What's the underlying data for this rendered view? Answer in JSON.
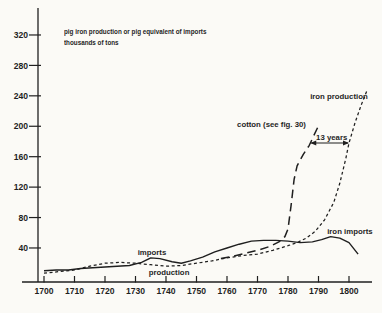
{
  "figure": {
    "title_line1": "pig iron production or pig equivalent of imports",
    "title_line2": "thousands of tons"
  },
  "colors": {
    "ink": "#1f1f1f",
    "paper": "#fbfaf6"
  },
  "chart_data": {
    "type": "line",
    "title": "pig iron production or pig equivalent of imports",
    "subtitle": "thousands of tons",
    "xlabel": "year",
    "ylabel": "thousands of tons",
    "xlim": [
      1693,
      1808
    ],
    "ylim": [
      -6,
      356
    ],
    "grid": false,
    "legend_position": "inline-labels",
    "x_ticks": [
      1700,
      1710,
      1720,
      1730,
      1740,
      1750,
      1760,
      1770,
      1780,
      1790,
      1800
    ],
    "y_ticks": [
      40,
      80,
      120,
      160,
      200,
      240,
      280,
      320
    ],
    "series": [
      {
        "name": "iron imports",
        "line_style": "solid",
        "points": [
          [
            1700,
            10
          ],
          [
            1704,
            11
          ],
          [
            1708,
            11
          ],
          [
            1712,
            13
          ],
          [
            1716,
            14
          ],
          [
            1720,
            15
          ],
          [
            1724,
            16
          ],
          [
            1728,
            17
          ],
          [
            1732,
            21
          ],
          [
            1735,
            27
          ],
          [
            1738,
            26
          ],
          [
            1742,
            22
          ],
          [
            1745,
            20
          ],
          [
            1748,
            23
          ],
          [
            1752,
            28
          ],
          [
            1756,
            35
          ],
          [
            1760,
            40
          ],
          [
            1764,
            45
          ],
          [
            1768,
            49
          ],
          [
            1772,
            50
          ],
          [
            1776,
            50
          ],
          [
            1780,
            49
          ],
          [
            1784,
            47
          ],
          [
            1788,
            48
          ],
          [
            1791,
            51
          ],
          [
            1794,
            55
          ],
          [
            1797,
            53
          ],
          [
            1800,
            47
          ],
          [
            1803,
            32
          ]
        ]
      },
      {
        "name": "iron production",
        "line_style": "short-dash",
        "points": [
          [
            1700,
            7
          ],
          [
            1705,
            9
          ],
          [
            1710,
            11
          ],
          [
            1715,
            16
          ],
          [
            1720,
            20
          ],
          [
            1725,
            21
          ],
          [
            1730,
            20
          ],
          [
            1735,
            18
          ],
          [
            1740,
            16
          ],
          [
            1745,
            17
          ],
          [
            1750,
            20
          ],
          [
            1755,
            23
          ],
          [
            1760,
            27
          ],
          [
            1765,
            30
          ],
          [
            1770,
            32
          ],
          [
            1775,
            37
          ],
          [
            1780,
            43
          ],
          [
            1783,
            47
          ],
          [
            1786,
            53
          ],
          [
            1789,
            62
          ],
          [
            1792,
            77
          ],
          [
            1795,
            100
          ],
          [
            1797,
            125
          ],
          [
            1799,
            158
          ],
          [
            1800,
            178
          ],
          [
            1802,
            205
          ],
          [
            1804,
            228
          ],
          [
            1806,
            248
          ]
        ]
      },
      {
        "name": "cotton (see fig. 30)",
        "line_style": "long-dash",
        "points": [
          [
            1758,
            26
          ],
          [
            1762,
            29
          ],
          [
            1766,
            33
          ],
          [
            1770,
            37
          ],
          [
            1774,
            42
          ],
          [
            1777,
            48
          ],
          [
            1779,
            55
          ],
          [
            1780,
            65
          ],
          [
            1781,
            95
          ],
          [
            1782,
            130
          ],
          [
            1783,
            148
          ],
          [
            1785,
            163
          ],
          [
            1787,
            175
          ],
          [
            1788.5,
            188
          ],
          [
            1789.8,
            199
          ]
        ]
      }
    ],
    "annotations": [
      {
        "id": "imports-label",
        "text": "imports",
        "x": 1735.4,
        "y": 31,
        "anchor": "middle"
      },
      {
        "id": "production-label",
        "text": "production",
        "x": 1741,
        "y": 4.5,
        "anchor": "middle"
      },
      {
        "id": "iron-imports-label",
        "text": "iron imports",
        "x": 1800.3,
        "y": 58.4,
        "anchor": "middle"
      },
      {
        "id": "iron-production-label",
        "text": "iron production",
        "x": 1796.7,
        "y": 236,
        "anchor": "middle"
      },
      {
        "id": "cotton-label",
        "text": "cotton  (see  fig. 30)",
        "x": 1763.3,
        "y": 199,
        "anchor": "start"
      },
      {
        "id": "thirteen-years-label",
        "text": "13 years",
        "x": 1789.2,
        "y": 182,
        "anchor": "start"
      }
    ],
    "arrow": {
      "label": "13 years",
      "y": 178,
      "x1": 1787.3,
      "x2": 1800,
      "double_headed": true
    }
  }
}
